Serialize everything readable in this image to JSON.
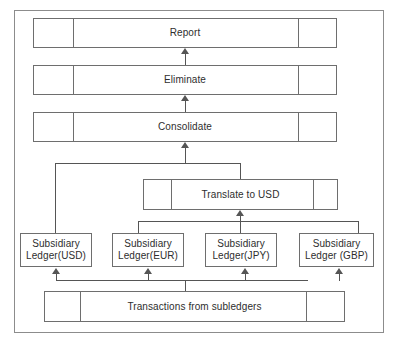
{
  "diagram": {
    "colors": {
      "frame_border": "#8c8c8c",
      "node_border": "#6e6e6e",
      "connector": "#555555",
      "background": "#ffffff",
      "text": "#2e2e2e"
    },
    "nodes": {
      "report": {
        "label": "Report"
      },
      "eliminate": {
        "label": "Eliminate"
      },
      "consolidate": {
        "label": "Consolidate"
      },
      "translate": {
        "label": "Translate to USD"
      },
      "ledger_usd": {
        "label": "Subsidiary\nLedger(USD)"
      },
      "ledger_eur": {
        "label": "Subsidiary\nLedger(EUR)"
      },
      "ledger_jpy": {
        "label": "Subsidiary\nLedger(JPY)"
      },
      "ledger_gbp": {
        "label": "Subsidiary\nLedger (GBP)"
      },
      "transactions": {
        "label": "Transactions from subledgers"
      }
    },
    "flow": [
      {
        "from": "transactions",
        "to": "ledger_usd"
      },
      {
        "from": "transactions",
        "to": "ledger_eur"
      },
      {
        "from": "transactions",
        "to": "ledger_jpy"
      },
      {
        "from": "transactions",
        "to": "ledger_gbp"
      },
      {
        "from": "ledger_eur",
        "to": "translate"
      },
      {
        "from": "ledger_jpy",
        "to": "translate"
      },
      {
        "from": "ledger_gbp",
        "to": "translate"
      },
      {
        "from": "ledger_usd",
        "to": "consolidate"
      },
      {
        "from": "translate",
        "to": "consolidate"
      },
      {
        "from": "consolidate",
        "to": "eliminate"
      },
      {
        "from": "eliminate",
        "to": "report"
      }
    ]
  }
}
